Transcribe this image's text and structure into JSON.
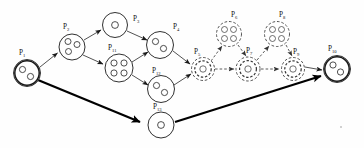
{
  "figure": {
    "width": 364,
    "height": 148,
    "background_color": "#fefefe",
    "stroke_color": "#1a1a1a",
    "dashed_stroke_color": "#333333"
  },
  "chart_data": {
    "type": "diagram",
    "diagram_kind": "petri-net",
    "title": "",
    "node_count": 13,
    "edge_count": 16,
    "nodes": [
      {
        "id": "P1",
        "label": "P",
        "sub": "1",
        "x": 27,
        "y": 73,
        "r": 13.5,
        "tokens": 2,
        "style": "solid",
        "double": true,
        "token_layout": "two-diag"
      },
      {
        "id": "P2",
        "label": "P",
        "sub": "2",
        "x": 72,
        "y": 47,
        "r": 13.0,
        "tokens": 3,
        "style": "solid",
        "double": false,
        "token_layout": "three"
      },
      {
        "id": "P3",
        "label": "P",
        "sub": "3",
        "x": 115,
        "y": 25,
        "r": 12.5,
        "tokens": 1,
        "style": "solid",
        "double": false,
        "token_layout": "one"
      },
      {
        "id": "P4",
        "label": "P",
        "sub": "4",
        "x": 160,
        "y": 45,
        "r": 13.5,
        "tokens": 2,
        "style": "solid",
        "double": false,
        "token_layout": "two-diag"
      },
      {
        "id": "P11",
        "label": "P",
        "sub": "11",
        "x": 119,
        "y": 68,
        "r": 14.0,
        "tokens": 4,
        "style": "solid",
        "double": false,
        "token_layout": "four"
      },
      {
        "id": "P12",
        "label": "P",
        "sub": "12",
        "x": 161,
        "y": 89,
        "r": 13.5,
        "tokens": 2,
        "style": "solid",
        "double": false,
        "token_layout": "two-diag"
      },
      {
        "id": "P13",
        "label": "P",
        "sub": "13",
        "x": 161,
        "y": 125,
        "r": 13.0,
        "tokens": 1,
        "style": "solid",
        "double": false,
        "token_layout": "one"
      },
      {
        "id": "P5",
        "label": "P",
        "sub": "5",
        "x": 203,
        "y": 69,
        "r": 11.5,
        "tokens": 1,
        "style": "dashed",
        "double": true,
        "token_layout": "one"
      },
      {
        "id": "P6",
        "label": "P",
        "sub": "6",
        "x": 229,
        "y": 34,
        "r": 12.5,
        "tokens": 4,
        "style": "dashed",
        "double": false,
        "token_layout": "four"
      },
      {
        "id": "P7",
        "label": "P",
        "sub": "7",
        "x": 248,
        "y": 69,
        "r": 12.0,
        "tokens": 1,
        "style": "dashed",
        "double": true,
        "token_layout": "one"
      },
      {
        "id": "P8",
        "label": "P",
        "sub": "8",
        "x": 277,
        "y": 34,
        "r": 12.5,
        "tokens": 4,
        "style": "dashed",
        "double": false,
        "token_layout": "four"
      },
      {
        "id": "P9",
        "label": "P",
        "sub": "9",
        "x": 293,
        "y": 69,
        "r": 11.5,
        "tokens": 1,
        "style": "dashed",
        "double": true,
        "token_layout": "one"
      },
      {
        "id": "P10",
        "label": "P",
        "sub": "10",
        "x": 337,
        "y": 69,
        "r": 13.5,
        "tokens": 2,
        "style": "solid",
        "double": true,
        "token_layout": "two-diag"
      }
    ],
    "edges": [
      {
        "from": "P1",
        "to": "P2",
        "style": "thin",
        "weight": 1
      },
      {
        "from": "P1",
        "to": "P13",
        "style": "thick",
        "weight": 1
      },
      {
        "from": "P2",
        "to": "P3",
        "style": "thin",
        "weight": 1
      },
      {
        "from": "P2",
        "to": "P11",
        "style": "thin",
        "weight": 1
      },
      {
        "from": "P3",
        "to": "P4",
        "style": "thin",
        "weight": 1
      },
      {
        "from": "P11",
        "to": "P4",
        "style": "thin",
        "weight": 1
      },
      {
        "from": "P11",
        "to": "P12",
        "style": "thin",
        "weight": 1
      },
      {
        "from": "P4",
        "to": "P5",
        "style": "thin",
        "weight": 1
      },
      {
        "from": "P12",
        "to": "P5",
        "style": "thin",
        "weight": 1
      },
      {
        "from": "P5",
        "to": "P6",
        "style": "dashed",
        "weight": 1
      },
      {
        "from": "P5",
        "to": "P7",
        "style": "dashed",
        "weight": 1
      },
      {
        "from": "P6",
        "to": "P7",
        "style": "dashed",
        "weight": 1
      },
      {
        "from": "P7",
        "to": "P8",
        "style": "dashed",
        "weight": 1
      },
      {
        "from": "P7",
        "to": "P9",
        "style": "dashed",
        "weight": 1
      },
      {
        "from": "P8",
        "to": "P9",
        "style": "dashed",
        "weight": 1
      },
      {
        "from": "P9",
        "to": "P10",
        "style": "thin",
        "weight": 1
      },
      {
        "from": "P13",
        "to": "P10",
        "style": "thick",
        "weight": 1
      }
    ],
    "legend": []
  },
  "labels": {
    "P1": "P₁",
    "P2": "P₂",
    "P3": "P₃",
    "P4": "P₄",
    "P5": "P₅",
    "P6": "P₆",
    "P7": "P₇",
    "P8": "P₈",
    "P9": "P₉",
    "P10": "P₁₀",
    "P11": "P₁₁",
    "P12": "P₁₂",
    "P13": "P₁₃"
  }
}
